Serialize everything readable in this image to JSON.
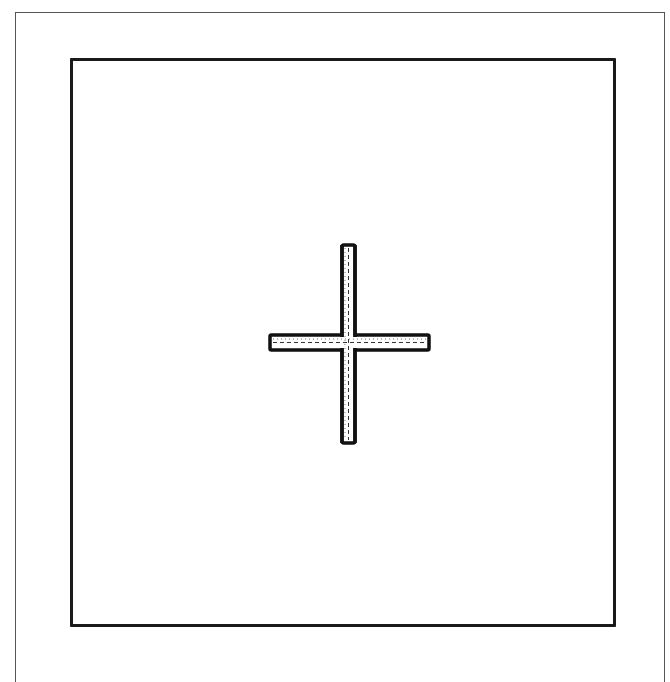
{
  "diagram": {
    "outer_frame": {
      "stroke": "#555555"
    },
    "inner_square": {
      "stroke": "#1a1a1a"
    },
    "cross": {
      "icon": "plus-cross",
      "outline_color": "#111111",
      "fill_color": "#ffffff",
      "centerline": "dashed"
    }
  }
}
